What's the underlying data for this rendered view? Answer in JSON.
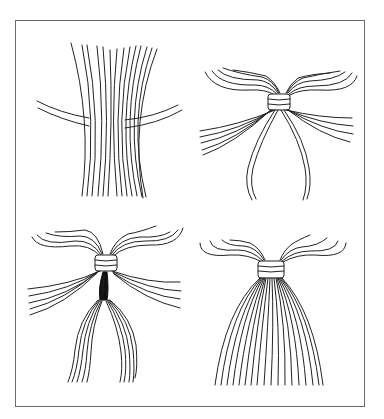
{
  "figure": {
    "panels": [
      {
        "id": 1,
        "position": "top-left",
        "label": "Strands laid across a tie cord"
      },
      {
        "id": 2,
        "position": "top-right",
        "label": "Strands folded and wrapped at center with tie ends hanging"
      },
      {
        "id": 3,
        "position": "bottom-left",
        "label": "Tie ends threaded down through the bundle"
      },
      {
        "id": 4,
        "position": "bottom-right",
        "label": "Finished tassel with strands hanging down"
      }
    ],
    "colors": {
      "line": "#222222",
      "frame": "#6b6b6b",
      "background": "#ffffff"
    }
  }
}
